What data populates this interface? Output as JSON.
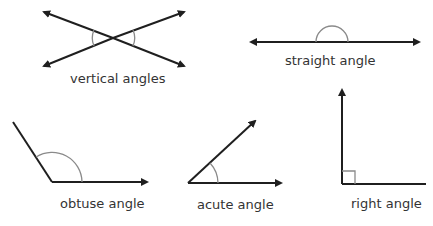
{
  "diagram": {
    "title": "",
    "colors": {
      "line": "#1f1f1f",
      "arc": "#8a8a8a",
      "text": "#333333",
      "background": "#ffffff"
    },
    "figures": [
      {
        "id": "vertical",
        "label": "vertical angles"
      },
      {
        "id": "straight",
        "label": "straight angle"
      },
      {
        "id": "obtuse",
        "label": "obtuse angle"
      },
      {
        "id": "acute",
        "label": "acute angle"
      },
      {
        "id": "right",
        "label": "right angle"
      }
    ]
  }
}
